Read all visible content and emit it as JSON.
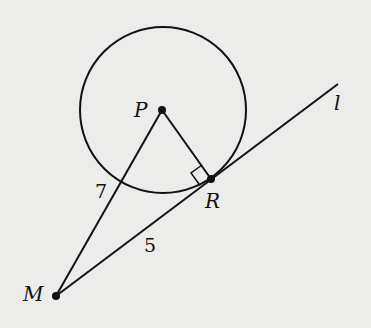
{
  "diagram": {
    "points": {
      "P": {
        "label": "P",
        "x": 162,
        "y": 110
      },
      "R": {
        "label": "R",
        "x": 211,
        "y": 179
      },
      "M": {
        "label": "M",
        "x": 56,
        "y": 296
      }
    },
    "line_label": "l",
    "circle": {
      "center": "P",
      "radius": 84
    },
    "segments": {
      "MP": {
        "label": "7"
      },
      "MR": {
        "label": "5"
      },
      "PR": {
        "label": ""
      }
    },
    "right_angle_at": "R",
    "colors": {
      "background": "#ececea",
      "ink": "#111111"
    }
  }
}
